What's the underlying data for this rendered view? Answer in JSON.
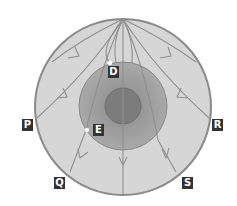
{
  "diagram": {
    "colors": {
      "mantle": "#d4d4d4",
      "mantle_border": "#8a8a8a",
      "outer_core": "#9e9e9e",
      "inner_core": "#7e7e7e",
      "wave_path": "#8f8f8f",
      "label_bg": "#333333",
      "label_fg": "#ffffff",
      "point": "#ffffff"
    },
    "labels": [
      {
        "id": "D",
        "text": "D",
        "x": 108,
        "y": 66
      },
      {
        "id": "E",
        "text": "E",
        "x": 93,
        "y": 124
      },
      {
        "id": "P",
        "text": "P",
        "x": 22,
        "y": 119
      },
      {
        "id": "R",
        "text": "R",
        "x": 212,
        "y": 119
      },
      {
        "id": "Q",
        "text": "Q",
        "x": 54,
        "y": 177
      },
      {
        "id": "S",
        "text": "S",
        "x": 182,
        "y": 177
      }
    ],
    "points": [
      {
        "id": "D",
        "x": 110,
        "y": 63
      },
      {
        "id": "E",
        "x": 87,
        "y": 130
      }
    ]
  }
}
